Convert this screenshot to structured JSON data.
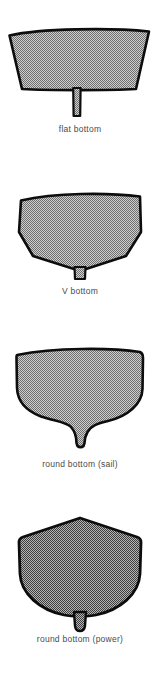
{
  "figure": {
    "background_color": "#ffffff",
    "outline_color": "#000000",
    "caption_color": "#4a4a4a",
    "fill_light": "#a6a6a6",
    "fill_dark": "#808080",
    "hulls": [
      {
        "id": "flat-bottom",
        "label": "flat bottom",
        "description": "wide flared topsides with flat bottom and thin straight keel fin",
        "fill_tone": "light",
        "keel": "thin straight fin"
      },
      {
        "id": "v-bottom",
        "label": "V bottom",
        "description": "flared topsides with hard chine and V-shaped deadrise, short keel stub",
        "fill_tone": "light",
        "keel": "short stub"
      },
      {
        "id": "round-bottom-sail",
        "label": "round bottom (sail)",
        "description": "rounded bilges with wineglass section and deep fin keel",
        "fill_tone": "light",
        "keel": "deep fin keel"
      },
      {
        "id": "round-bottom-power",
        "label": "round bottom (power)",
        "description": "peaked deck with deep rounded bilge and small skeg stub",
        "fill_tone": "dark",
        "keel": "small skeg stub"
      }
    ]
  }
}
